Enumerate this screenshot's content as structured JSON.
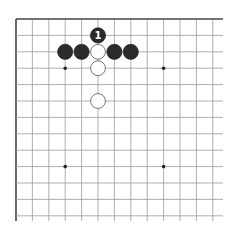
{
  "board": {
    "origin": {
      "x": 16,
      "y": 19
    },
    "spacing": 16.4,
    "cols": 13,
    "rows": 13,
    "extend_right": 223,
    "extend_bottom": 221,
    "line_color": "#9a9a9a",
    "edge_color": "#444444",
    "star_points": [
      [
        3,
        3
      ],
      [
        9,
        3
      ],
      [
        3,
        9
      ],
      [
        9,
        9
      ]
    ]
  },
  "stones": [
    {
      "color": "black",
      "col": 5,
      "row": 1,
      "label": "1"
    },
    {
      "color": "black",
      "col": 3,
      "row": 2
    },
    {
      "color": "black",
      "col": 4,
      "row": 2
    },
    {
      "color": "white",
      "col": 5,
      "row": 2
    },
    {
      "color": "black",
      "col": 6,
      "row": 2
    },
    {
      "color": "black",
      "col": 7,
      "row": 2
    },
    {
      "color": "white",
      "col": 5,
      "row": 3
    },
    {
      "color": "white",
      "col": 5,
      "row": 5
    }
  ]
}
